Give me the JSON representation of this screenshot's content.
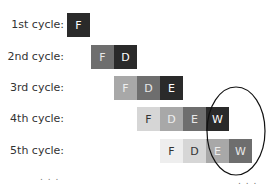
{
  "rows": [
    {
      "label": "1st cycle:",
      "y": 13,
      "stages": [
        {
          "t": "F",
          "x": 67,
          "bg": "#2a2a2a",
          "fg": "#ffffff"
        }
      ]
    },
    {
      "label": "2nd cycle:",
      "y": 45,
      "stages": [
        {
          "t": "F",
          "x": 91,
          "bg": "#6e6e6e",
          "fg": "#e8e8e8"
        },
        {
          "t": "D",
          "x": 114,
          "bg": "#2a2a2a",
          "fg": "#ffffff"
        }
      ]
    },
    {
      "label": "3rd cycle:",
      "y": 76,
      "stages": [
        {
          "t": "F",
          "x": 114,
          "bg": "#a8a8a8",
          "fg": "#eeeeee"
        },
        {
          "t": "D",
          "x": 137,
          "bg": "#6e6e6e",
          "fg": "#e8e8e8"
        },
        {
          "t": "E",
          "x": 160,
          "bg": "#2a2a2a",
          "fg": "#ffffff"
        }
      ]
    },
    {
      "label": "4th cycle:",
      "y": 107,
      "stages": [
        {
          "t": "F",
          "x": 137,
          "bg": "#d6d6d6",
          "fg": "#333333"
        },
        {
          "t": "D",
          "x": 160,
          "bg": "#a8a8a8",
          "fg": "#eeeeee"
        },
        {
          "t": "E",
          "x": 183,
          "bg": "#6e6e6e",
          "fg": "#e8e8e8"
        },
        {
          "t": "W",
          "x": 206,
          "bg": "#2a2a2a",
          "fg": "#ffffff"
        }
      ]
    },
    {
      "label": "5th cycle:",
      "y": 139,
      "stages": [
        {
          "t": "F",
          "x": 160,
          "bg": "#eeeeee",
          "fg": "#333333"
        },
        {
          "t": "D",
          "x": 183,
          "bg": "#d6d6d6",
          "fg": "#333333"
        },
        {
          "t": "E",
          "x": 206,
          "bg": "#a8a8a8",
          "fg": "#eeeeee"
        },
        {
          "t": "W",
          "x": 229,
          "bg": "#6e6e6e",
          "fg": "#e8e8e8"
        }
      ]
    }
  ],
  "ellipsis_left": ". . .",
  "ellipsis_right": ". . .",
  "highlight": {
    "cx": 236,
    "cy": 131,
    "rx": 29,
    "ry": 44
  }
}
